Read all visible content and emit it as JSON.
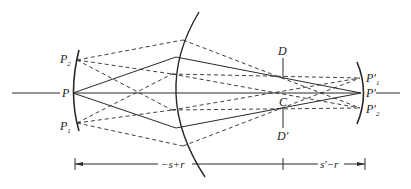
{
  "diagram": {
    "type": "optical-ray-diagram",
    "labels": {
      "P": "P",
      "P1": "P",
      "P1_sub": "1",
      "P2": "P",
      "P2_sub": "2",
      "D": "D",
      "D_prime": "D′",
      "C": "C",
      "P_prime": "P′",
      "P1_prime": "P′",
      "P1_prime_sub": "1",
      "P2_prime": "P′",
      "P2_prime_sub": "2"
    },
    "dimensions": {
      "left_span": "−s+r",
      "right_span": "s′−r"
    },
    "colors": {
      "line": "#2a2a2a",
      "background": "#ffffff"
    }
  }
}
